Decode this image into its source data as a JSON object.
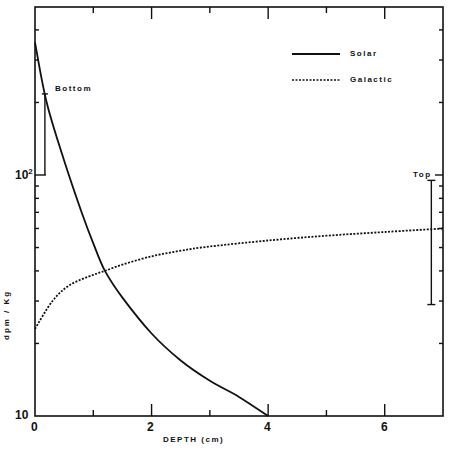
{
  "chart_data": {
    "type": "line",
    "title": "",
    "xlabel": "DEPTH (cm)",
    "ylabel": "dpm / Kg",
    "xlim": [
      0,
      7
    ],
    "ylim": [
      10,
      500
    ],
    "yscale": "log",
    "grid": false,
    "legend_position": "upper right",
    "x_ticks": [
      "0",
      "2",
      "4",
      "6"
    ],
    "y_ticks": [
      "10",
      "10²"
    ],
    "series": [
      {
        "name": "Solar",
        "style": "solid",
        "x": [
          0,
          0.2,
          0.5,
          0.8,
          1.0,
          1.2,
          1.5,
          2.0,
          2.5,
          3.0,
          3.5,
          4.0
        ],
        "y": [
          355,
          200,
          115,
          70,
          52,
          40,
          31,
          22,
          17,
          14,
          12,
          10
        ]
      },
      {
        "name": "Galactic",
        "style": "dotted",
        "x": [
          0,
          0.3,
          0.6,
          1.0,
          1.2,
          1.5,
          2.0,
          2.5,
          3.0,
          4.0,
          5.0,
          6.0,
          7.0
        ],
        "y": [
          23,
          30,
          35,
          38.5,
          40,
          42.5,
          46,
          48.5,
          50.5,
          53.5,
          56,
          58,
          60
        ]
      }
    ],
    "annotations": [
      {
        "text": "Bottom",
        "type": "error_bar",
        "x": 0.17,
        "y_low": 100,
        "y_high": 217
      },
      {
        "text": "Top",
        "type": "error_bar",
        "x": 6.8,
        "y_low": 29,
        "y_high": 95
      }
    ]
  },
  "labels": {
    "x_tick_0": "0",
    "x_tick_2": "2",
    "x_tick_4": "4",
    "x_tick_6": "6",
    "y_tick_10": "10",
    "y_tick_100_base": "10",
    "y_tick_100_exp": "2",
    "xlabel": "DEPTH  (cm)",
    "ylabel": "dpm / Kg",
    "legend_solar": "Solar",
    "legend_galactic": "Galactic",
    "annot_bottom": "Bottom",
    "annot_top": "Top"
  }
}
